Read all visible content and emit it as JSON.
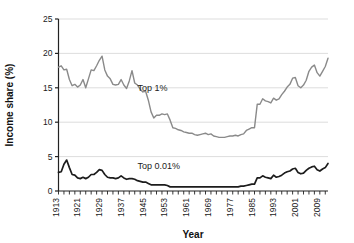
{
  "chart_data": {
    "type": "line",
    "title": "",
    "xlabel": "Year",
    "ylabel": "Income share (%)",
    "xlim": [
      1913,
      2012
    ],
    "ylim": [
      0,
      25
    ],
    "yticks": [
      0,
      5,
      10,
      15,
      20,
      25
    ],
    "xticks": [
      1913,
      1921,
      1929,
      1937,
      1945,
      1953,
      1961,
      1969,
      1977,
      1985,
      1993,
      2001,
      2009
    ],
    "grid": "horizontal",
    "legend_position": "inline-annotation",
    "series": [
      {
        "name": "Top 1%",
        "label": "Top 1%",
        "color": "#8a8a8a",
        "width": 1.4,
        "x": [
          1913,
          1914,
          1915,
          1916,
          1917,
          1918,
          1919,
          1920,
          1921,
          1922,
          1923,
          1924,
          1925,
          1926,
          1927,
          1928,
          1929,
          1930,
          1931,
          1932,
          1933,
          1934,
          1935,
          1936,
          1937,
          1938,
          1939,
          1940,
          1941,
          1942,
          1943,
          1944,
          1945,
          1946,
          1947,
          1948,
          1949,
          1950,
          1951,
          1952,
          1953,
          1954,
          1955,
          1956,
          1957,
          1958,
          1959,
          1960,
          1961,
          1962,
          1963,
          1964,
          1965,
          1966,
          1967,
          1968,
          1969,
          1970,
          1971,
          1972,
          1973,
          1974,
          1975,
          1976,
          1977,
          1978,
          1979,
          1980,
          1981,
          1982,
          1983,
          1984,
          1985,
          1986,
          1987,
          1988,
          1989,
          1990,
          1991,
          1992,
          1993,
          1994,
          1995,
          1996,
          1997,
          1998,
          1999,
          2000,
          2001,
          2002,
          2003,
          2004,
          2005,
          2006,
          2007,
          2008,
          2009,
          2010,
          2011,
          2012
        ],
        "values": [
          18.0,
          18.2,
          17.6,
          17.7,
          16.2,
          15.3,
          15.5,
          15.1,
          15.4,
          16.2,
          15.0,
          16.3,
          17.6,
          17.5,
          18.2,
          19.0,
          19.6,
          17.6,
          16.7,
          16.3,
          15.5,
          15.4,
          15.5,
          16.2,
          15.4,
          14.9,
          16.0,
          17.5,
          15.7,
          15.4,
          14.8,
          14.4,
          14.5,
          13.2,
          11.5,
          10.6,
          11.0,
          11.0,
          11.2,
          11.1,
          11.2,
          10.3,
          9.2,
          9.1,
          8.9,
          8.8,
          8.6,
          8.5,
          8.4,
          8.4,
          8.2,
          8.1,
          8.2,
          8.3,
          8.4,
          8.2,
          8.3,
          8.0,
          7.9,
          7.8,
          7.8,
          7.8,
          7.9,
          8.0,
          8.0,
          8.1,
          8.0,
          8.2,
          8.3,
          8.8,
          9.0,
          9.2,
          9.2,
          12.6,
          12.6,
          13.4,
          13.1,
          13.0,
          12.8,
          13.5,
          13.2,
          13.4,
          14.0,
          14.5,
          15.1,
          15.5,
          16.4,
          16.5,
          15.3,
          15.0,
          15.4,
          16.1,
          17.4,
          18.0,
          18.3,
          17.2,
          16.7,
          17.4,
          18.1,
          19.3
        ]
      },
      {
        "name": "Top 0.01%",
        "label": "Top 0.01%",
        "color": "#1c1c1c",
        "width": 1.7,
        "x": [
          1913,
          1914,
          1915,
          1916,
          1917,
          1918,
          1919,
          1920,
          1921,
          1922,
          1923,
          1924,
          1925,
          1926,
          1927,
          1928,
          1929,
          1930,
          1931,
          1932,
          1933,
          1934,
          1935,
          1936,
          1937,
          1938,
          1939,
          1940,
          1941,
          1942,
          1943,
          1944,
          1945,
          1946,
          1947,
          1948,
          1949,
          1950,
          1951,
          1952,
          1953,
          1954,
          1955,
          1956,
          1957,
          1958,
          1959,
          1960,
          1961,
          1962,
          1963,
          1964,
          1965,
          1966,
          1967,
          1968,
          1969,
          1970,
          1971,
          1972,
          1973,
          1974,
          1975,
          1976,
          1977,
          1978,
          1979,
          1980,
          1981,
          1982,
          1983,
          1984,
          1985,
          1986,
          1987,
          1988,
          1989,
          1990,
          1991,
          1992,
          1993,
          1994,
          1995,
          1996,
          1997,
          1998,
          1999,
          2000,
          2001,
          2002,
          2003,
          2004,
          2005,
          2006,
          2007,
          2008,
          2009,
          2010,
          2011,
          2012
        ],
        "values": [
          2.7,
          2.8,
          3.9,
          4.5,
          3.4,
          2.4,
          2.3,
          1.9,
          1.8,
          2.0,
          1.8,
          2.0,
          2.4,
          2.4,
          2.7,
          3.1,
          3.0,
          2.4,
          2.0,
          1.9,
          1.9,
          1.8,
          1.9,
          2.2,
          1.9,
          1.7,
          1.8,
          1.8,
          1.7,
          1.5,
          1.4,
          1.3,
          1.3,
          1.1,
          0.9,
          0.9,
          0.9,
          0.9,
          0.9,
          0.9,
          0.8,
          0.6,
          0.6,
          0.6,
          0.6,
          0.6,
          0.6,
          0.6,
          0.6,
          0.6,
          0.6,
          0.6,
          0.6,
          0.6,
          0.6,
          0.6,
          0.6,
          0.6,
          0.6,
          0.6,
          0.6,
          0.6,
          0.6,
          0.6,
          0.6,
          0.6,
          0.6,
          0.7,
          0.7,
          0.8,
          0.9,
          1.0,
          1.0,
          1.9,
          1.9,
          2.2,
          2.0,
          1.9,
          1.8,
          2.3,
          2.0,
          2.1,
          2.3,
          2.6,
          2.8,
          2.9,
          3.2,
          3.3,
          2.7,
          2.5,
          2.6,
          3.0,
          3.3,
          3.5,
          3.6,
          3.1,
          2.9,
          3.2,
          3.4,
          4.0
        ]
      }
    ],
    "annotations": [
      {
        "text": "Top 1%",
        "x": 1942,
        "y": 14.5
      },
      {
        "text": "Top 0.01%",
        "x": 1942,
        "y": 3.2
      }
    ]
  },
  "colors": {
    "axis": "#222222",
    "grid": "#d9d9d9",
    "background": "#ffffff",
    "top1": "#8a8a8a",
    "top001": "#1c1c1c"
  }
}
